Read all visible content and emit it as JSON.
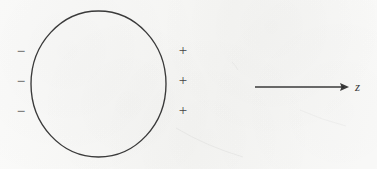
{
  "figure": {
    "background_color": "#f6f6f4",
    "ink_color": "#2b2b2b",
    "shape": {
      "name": "circle",
      "center_x": 98.5,
      "center_y": 84,
      "radius_x": 67.5,
      "radius_y": 73
    },
    "negative_charges": {
      "symbol": "−",
      "count": 3,
      "positions_y": [
        44,
        74,
        104
      ],
      "position_x": 14
    },
    "positive_charges": {
      "symbol": "+",
      "count": 3,
      "positions_y": [
        43,
        73,
        103
      ],
      "position_x": 176
    },
    "axis": {
      "label": "z",
      "arrow_start_x": 255,
      "arrow_end_x": 349,
      "arrow_y": 87,
      "label_x": 355,
      "label_y": 80
    }
  }
}
